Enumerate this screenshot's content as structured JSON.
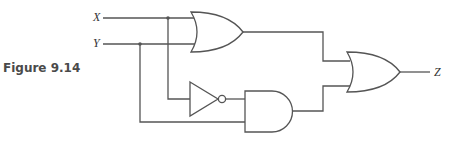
{
  "figure": {
    "label": "Figure 9.14"
  },
  "circuit": {
    "inputs": [
      "X",
      "Y"
    ],
    "output": "Z",
    "gates": [
      {
        "type": "OR",
        "inputs": [
          "X",
          "Y"
        ]
      },
      {
        "type": "NOT",
        "inputs": [
          "X"
        ]
      },
      {
        "type": "AND",
        "inputs": [
          "NOT X",
          "Y"
        ]
      },
      {
        "type": "OR",
        "inputs": [
          "OR1",
          "AND1"
        ],
        "output": "Z"
      }
    ],
    "colors": {
      "stroke": "#555555",
      "background": "#ffffff"
    }
  }
}
